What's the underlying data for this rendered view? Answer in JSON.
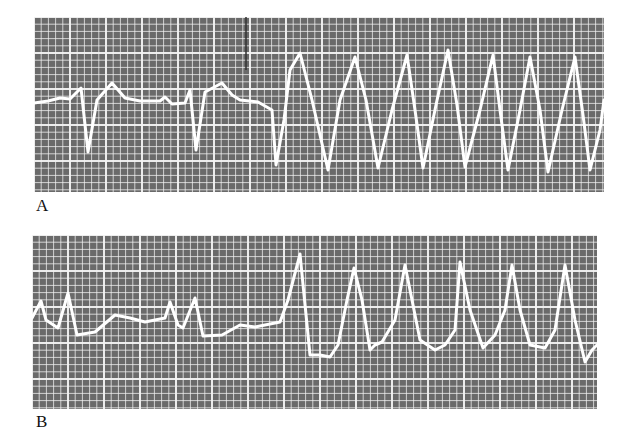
{
  "figure": {
    "background": "#ffffff",
    "grid_fill": "#6a6a6a",
    "grid_line": "#f4f4f4",
    "trace_color": "#ffffff"
  },
  "panels": [
    {
      "label": "A"
    },
    {
      "label": "B"
    }
  ],
  "chart_data": [
    {
      "type": "line",
      "title": "",
      "panel_label": "A",
      "xlabel": "",
      "ylabel": "",
      "grid": true,
      "description": "ECG rhythm strip: sinus-type complexes followed by wide sinusoidal tachycardia (7 cycles)",
      "bounds_px": {
        "x": 34,
        "y": 17,
        "w": 570,
        "h": 175
      },
      "x": [
        34,
        48,
        60,
        70,
        81,
        88,
        97,
        112,
        125,
        140,
        160,
        165,
        172,
        185,
        190,
        196,
        205,
        222,
        232,
        240,
        258,
        272,
        276,
        284,
        290,
        300,
        312,
        328,
        340,
        355,
        366,
        378,
        392,
        407,
        415,
        423,
        436,
        448,
        457,
        465,
        480,
        493,
        500,
        508,
        520,
        530,
        540,
        548,
        562,
        575,
        583,
        590,
        600,
        604
      ],
      "values": [
        103,
        101,
        98,
        99,
        88,
        152,
        100,
        83,
        98,
        101,
        101,
        97,
        104,
        103,
        90,
        150,
        92,
        83,
        95,
        100,
        102,
        110,
        165,
        120,
        70,
        53,
        100,
        170,
        100,
        57,
        100,
        168,
        110,
        55,
        110,
        168,
        105,
        50,
        105,
        167,
        110,
        55,
        110,
        170,
        110,
        57,
        110,
        172,
        110,
        57,
        115,
        170,
        130,
        100
      ]
    },
    {
      "type": "line",
      "title": "",
      "panel_label": "B",
      "xlabel": "",
      "ylabel": "",
      "grid": true,
      "description": "ECG rhythm strip: narrow complexes then onset of wide-complex tachycardia (7 peaks)",
      "bounds_px": {
        "x": 32,
        "y": 235,
        "w": 565,
        "h": 174
      },
      "x": [
        32,
        41,
        46,
        58,
        68,
        77,
        95,
        115,
        130,
        145,
        165,
        170,
        178,
        183,
        195,
        203,
        222,
        240,
        255,
        280,
        288,
        300,
        310,
        320,
        330,
        338,
        347,
        354,
        362,
        370,
        375,
        382,
        395,
        405,
        412,
        420,
        435,
        445,
        455,
        460,
        470,
        483,
        495,
        505,
        512,
        520,
        530,
        545,
        555,
        565,
        575,
        585,
        592,
        597
      ],
      "values": [
        318,
        301,
        320,
        328,
        293,
        335,
        332,
        315,
        318,
        322,
        318,
        302,
        325,
        328,
        298,
        336,
        335,
        325,
        327,
        322,
        300,
        254,
        355,
        355,
        357,
        345,
        300,
        268,
        300,
        350,
        345,
        342,
        320,
        265,
        300,
        340,
        350,
        345,
        330,
        262,
        310,
        348,
        335,
        310,
        265,
        310,
        345,
        348,
        330,
        265,
        320,
        362,
        350,
        345
      ]
    }
  ]
}
